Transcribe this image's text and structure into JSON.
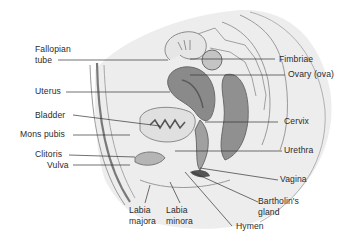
{
  "diagram": {
    "colors": {
      "background": "#ffffff",
      "body_fill": "#ececec",
      "organ_dark": "#7a7a7a",
      "organ_mid": "#a8a8a8",
      "organ_light": "#d6d6d6",
      "outline": "#8a8a8a",
      "leader_line": "#333333",
      "text": "#2b2b2b"
    },
    "labels": {
      "fallopian_tube": "Fallopian\ntube",
      "uterus": "Uterus",
      "bladder": "Bladder",
      "mons_pubis": "Mons pubis",
      "clitoris": "Clitoris",
      "vulva": "Vulva",
      "labia_majora": "Labia\nmajora",
      "labia_minora": "Labia\nminora",
      "hymen": "Hymen",
      "bartholins_gland": "Bartholin's\ngland",
      "vagina": "Vagina",
      "urethra": "Urethra",
      "cervix": "Cervix",
      "ovary": "Ovary (ova)",
      "fimbriae": "Fimbriae"
    }
  }
}
